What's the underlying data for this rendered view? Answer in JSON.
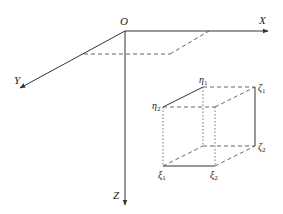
{
  "diagram": {
    "axes": {
      "origin_label": "O",
      "x_label": "X",
      "y_label": "Y",
      "z_label": "Z"
    },
    "box_labels": {
      "eta1": {
        "base": "η",
        "sub": "1"
      },
      "eta2": {
        "base": "η",
        "sub": "2"
      },
      "zeta1": {
        "base": "ζ",
        "sub": "1"
      },
      "zeta2": {
        "base": "ζ",
        "sub": "2"
      },
      "xi1": {
        "base": "ξ",
        "sub": "1"
      },
      "xi2": {
        "base": "ξ",
        "sub": "2"
      }
    },
    "colors": {
      "line": "#333333",
      "dash": "#555555"
    }
  }
}
